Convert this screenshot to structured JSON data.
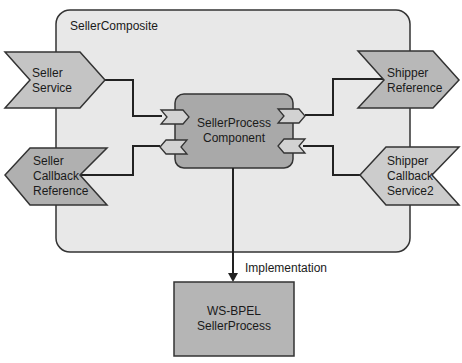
{
  "composite": {
    "title": "SellerComposite",
    "fill": "#e8e8e8"
  },
  "services": [
    {
      "id": "seller-service",
      "line1": "Seller",
      "line2": "Service",
      "fill": "#c4c4c4"
    },
    {
      "id": "shipper-callback-service2",
      "line1": "Shipper",
      "line2": "Callback",
      "line3": "Service2",
      "fill": "#cccccc"
    }
  ],
  "references": [
    {
      "id": "shipper-reference",
      "line1": "Shipper",
      "line2": "Reference",
      "fill": "#b8b8b8"
    },
    {
      "id": "seller-callback-reference",
      "line1": "Seller",
      "line2": "Callback",
      "line3": "Reference",
      "fill": "#b0b0b0"
    }
  ],
  "component": {
    "line1": "SellerProcess",
    "line2": "Component",
    "fill": "#a9a9a9"
  },
  "implementation": {
    "edge_label": "Implementation",
    "line1": "WS-BPEL",
    "line2": "SellerProcess",
    "fill": "#b5b5b5"
  },
  "colors": {
    "stroke": "#333333",
    "port_fill": "#d2d2d2"
  }
}
